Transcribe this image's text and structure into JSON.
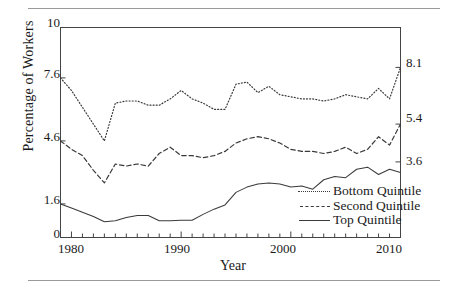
{
  "figure": {
    "ylabel": "Percentage of Workers",
    "xlabel": "Year",
    "left_ticks": [
      {
        "label": "10",
        "value": 10
      },
      {
        "label": "7.6",
        "value": 7.6
      },
      {
        "label": "4.6",
        "value": 4.6
      },
      {
        "label": "1.6",
        "value": 1.6
      },
      {
        "label": "0",
        "value": 0
      }
    ],
    "right_ticks": [
      {
        "label": "8.1",
        "value": 8.1
      },
      {
        "label": "5.4",
        "value": 5.4
      },
      {
        "label": "3.6",
        "value": 3.6
      }
    ],
    "x_ticks": [
      "1980",
      "1990",
      "2000",
      "2010"
    ],
    "legend": [
      {
        "label": "Bottom Quintile",
        "style": "dotted"
      },
      {
        "label": "Second Quintile",
        "style": "dashed"
      },
      {
        "label": "Top Quintile",
        "style": "solid"
      }
    ]
  },
  "chart_data": {
    "type": "line",
    "title": "",
    "xlabel": "Year",
    "ylabel": "Percentage of Workers",
    "xlim": [
      1979,
      2010
    ],
    "ylim": [
      0,
      10
    ],
    "grid": false,
    "legend_position": "inside-lower-right",
    "x_tick_labels": [
      "1980",
      "1990",
      "2000",
      "2010"
    ],
    "left_axis_tick_values": [
      0,
      1.6,
      4.6,
      7.6,
      10
    ],
    "right_axis_tick_values": [
      3.6,
      5.4,
      8.1
    ],
    "x": [
      1979,
      1980,
      1981,
      1982,
      1983,
      1984,
      1985,
      1986,
      1987,
      1988,
      1989,
      1990,
      1991,
      1992,
      1993,
      1994,
      1995,
      1996,
      1997,
      1998,
      1999,
      2000,
      2001,
      2002,
      2003,
      2004,
      2005,
      2006,
      2007,
      2008,
      2009,
      2010
    ],
    "series": [
      {
        "name": "Bottom Quintile",
        "style": "dotted",
        "color": "#3a3a3a",
        "values": [
          7.6,
          7.0,
          6.2,
          5.4,
          4.6,
          6.4,
          6.5,
          6.5,
          6.3,
          6.3,
          6.6,
          7.0,
          6.6,
          6.4,
          6.1,
          6.1,
          7.3,
          7.4,
          6.9,
          7.2,
          6.8,
          6.7,
          6.6,
          6.6,
          6.5,
          6.6,
          6.8,
          6.7,
          6.6,
          7.1,
          6.6,
          8.1
        ]
      },
      {
        "name": "Second Quintile",
        "style": "dashed",
        "color": "#3a3a3a",
        "values": [
          4.6,
          4.2,
          3.9,
          3.2,
          2.6,
          3.5,
          3.4,
          3.5,
          3.4,
          4.0,
          4.3,
          3.9,
          3.9,
          3.8,
          3.9,
          4.1,
          4.5,
          4.7,
          4.8,
          4.7,
          4.5,
          4.2,
          4.1,
          4.1,
          4.0,
          4.1,
          4.3,
          4.0,
          4.2,
          4.8,
          4.4,
          5.4
        ]
      },
      {
        "name": "Top Quintile",
        "style": "solid",
        "color": "#3a3a3a",
        "values": [
          1.6,
          1.4,
          1.2,
          1.0,
          0.75,
          0.8,
          0.95,
          1.05,
          1.05,
          0.8,
          0.8,
          0.82,
          0.82,
          1.1,
          1.35,
          1.55,
          2.15,
          2.4,
          2.55,
          2.6,
          2.55,
          2.4,
          2.45,
          2.3,
          2.75,
          2.9,
          2.85,
          3.25,
          3.35,
          3.0,
          3.25,
          3.1
        ]
      }
    ]
  }
}
